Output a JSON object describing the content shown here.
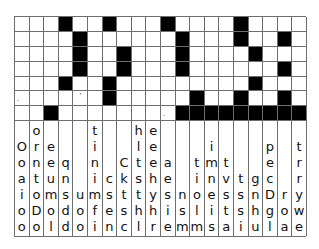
{
  "puzzle": {
    "type": "fallen-phrase / quote-falls grid",
    "columns": 20,
    "rows": 7,
    "grid": [
      "...#..#...#....#....",
      "....#......#...#..#.",
      "....#..#...#....#...",
      "....#..#...#......#.",
      "...#..#.........#...",
      "......#.....#..#..#.",
      "..#........#########"
    ],
    "marks": [
      {
        "row": 5,
        "col": 0,
        "glyph": ".",
        "kind": "dot"
      },
      {
        "row": 5,
        "col": 4,
        "glyph": "'",
        "kind": "apos"
      },
      {
        "row": 6,
        "col": 10,
        "glyph": ".",
        "kind": "dot"
      }
    ],
    "letter_columns": [
      [
        "O",
        "o",
        "a",
        "i",
        "o",
        "o"
      ],
      [
        "o",
        "r",
        "n",
        "t",
        "o",
        "D",
        "o"
      ],
      [
        "e",
        "e",
        "u",
        "m",
        "o",
        "l"
      ],
      [
        "q",
        "n",
        "s",
        "d",
        "d"
      ],
      [
        "u",
        "o",
        "o"
      ],
      [
        "t",
        "i",
        "n",
        "i",
        "m",
        "f",
        "i"
      ],
      [
        "c",
        "s",
        "e",
        "n"
      ],
      [
        "C",
        "k",
        "t",
        "s",
        "c"
      ],
      [
        "h",
        "l",
        "t",
        "s",
        "t",
        "h",
        "l"
      ],
      [
        "e",
        "e",
        "e",
        "h",
        "y",
        "h",
        "r"
      ],
      [
        "a",
        "e",
        "s",
        "i",
        "e"
      ],
      [
        "n",
        "s",
        "m"
      ],
      [
        "t",
        "i",
        "o",
        "l",
        "m"
      ],
      [
        "i",
        "m",
        "n",
        "e",
        "i",
        "s"
      ],
      [
        "t",
        "v",
        "s",
        "t",
        "a"
      ],
      [
        "t",
        "s",
        "s",
        "i"
      ],
      [
        "g",
        "n",
        "h",
        "u"
      ],
      [
        "p",
        "e",
        "c",
        "D",
        "g",
        "l"
      ],
      [
        "r",
        "o",
        "a"
      ],
      [
        "t",
        "r",
        "r",
        "y",
        "w",
        "e"
      ]
    ]
  }
}
